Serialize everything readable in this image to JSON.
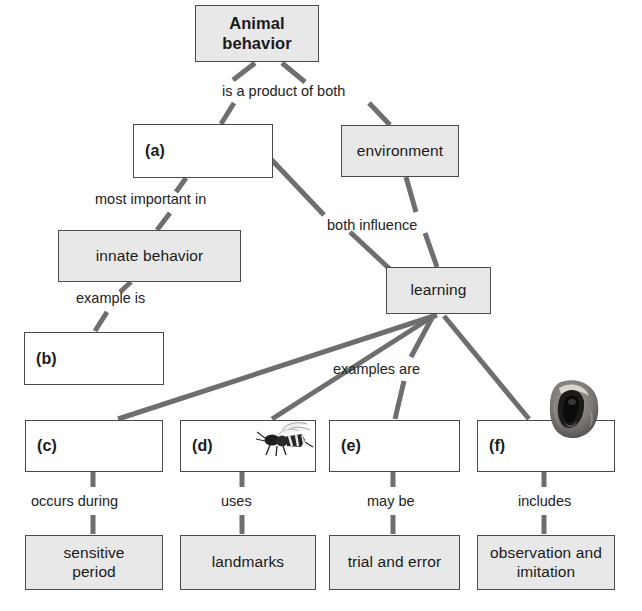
{
  "diagram": {
    "style": {
      "box_border": "#4a4a4a",
      "box_shaded_fill": "#e8e8e8",
      "box_plain_fill": "#ffffff",
      "connector": "#6e6e6e",
      "text": "#1a1a1a",
      "background": "#ffffff"
    },
    "nodes": [
      {
        "id": "animal-behavior",
        "label": "Animal\nbehavior",
        "shaded": true,
        "blank": false,
        "x": 195,
        "y": 5,
        "w": 124,
        "h": 57
      },
      {
        "id": "a",
        "label": "(a)",
        "shaded": false,
        "blank": true,
        "x": 133,
        "y": 124,
        "w": 140,
        "h": 54
      },
      {
        "id": "environment",
        "label": "environment",
        "shaded": true,
        "blank": false,
        "x": 341,
        "y": 125,
        "w": 118,
        "h": 52
      },
      {
        "id": "innate-behavior",
        "label": "innate behavior",
        "shaded": true,
        "blank": false,
        "x": 58,
        "y": 230,
        "w": 183,
        "h": 52
      },
      {
        "id": "learning",
        "label": "learning",
        "shaded": true,
        "blank": false,
        "x": 386,
        "y": 267,
        "w": 105,
        "h": 47
      },
      {
        "id": "b",
        "label": "(b)",
        "shaded": false,
        "blank": true,
        "x": 24,
        "y": 332,
        "w": 140,
        "h": 53
      },
      {
        "id": "c",
        "label": "(c)",
        "shaded": false,
        "blank": true,
        "x": 25,
        "y": 420,
        "w": 138,
        "h": 52
      },
      {
        "id": "d",
        "label": "(d)",
        "shaded": false,
        "blank": true,
        "x": 180,
        "y": 420,
        "w": 136,
        "h": 52
      },
      {
        "id": "e",
        "label": "(e)",
        "shaded": false,
        "blank": true,
        "x": 329,
        "y": 420,
        "w": 131,
        "h": 52
      },
      {
        "id": "f",
        "label": "(f)",
        "shaded": false,
        "blank": true,
        "x": 477,
        "y": 420,
        "w": 138,
        "h": 52
      },
      {
        "id": "sensitive-period",
        "label": "sensitive\nperiod",
        "shaded": true,
        "blank": false,
        "x": 25,
        "y": 535,
        "w": 138,
        "h": 55
      },
      {
        "id": "landmarks",
        "label": "landmarks",
        "shaded": true,
        "blank": false,
        "x": 180,
        "y": 535,
        "w": 136,
        "h": 55
      },
      {
        "id": "trial-and-error",
        "label": "trial and error",
        "shaded": true,
        "blank": false,
        "x": 329,
        "y": 535,
        "w": 131,
        "h": 55
      },
      {
        "id": "observation-and-imitation",
        "label": "observation and\nimitation",
        "shaded": true,
        "blank": false,
        "x": 477,
        "y": 535,
        "w": 138,
        "h": 55
      }
    ],
    "link_labels": [
      {
        "id": "is-a-product-of-both",
        "text": "is a product of both",
        "x": 222,
        "y": 84
      },
      {
        "id": "most-important-in",
        "text": "most important in",
        "x": 95,
        "y": 192
      },
      {
        "id": "both-influence",
        "text": "both influence",
        "x": 327,
        "y": 218
      },
      {
        "id": "example-is",
        "text": "example is",
        "x": 76,
        "y": 291
      },
      {
        "id": "examples-are",
        "text": "examples are",
        "x": 333,
        "y": 362
      },
      {
        "id": "occurs-during",
        "text": "occurs during",
        "x": 31,
        "y": 494
      },
      {
        "id": "uses",
        "text": "uses",
        "x": 221,
        "y": 494
      },
      {
        "id": "may-be",
        "text": "may be",
        "x": 367,
        "y": 494
      },
      {
        "id": "includes",
        "text": "includes",
        "x": 518,
        "y": 494
      }
    ],
    "edges": [
      {
        "id": "animal-behavior-to-a-upper",
        "from": "animal-behavior",
        "to": "is-a-product-of-both",
        "x1": 255,
        "y1": 63,
        "x2": 233,
        "y2": 80
      },
      {
        "id": "animal-behavior-to-environment-upper",
        "from": "animal-behavior",
        "to": "is-a-product-of-both",
        "x1": 282,
        "y1": 63,
        "x2": 305,
        "y2": 82
      },
      {
        "id": "is-a-product-of-both-to-a",
        "from": "is-a-product-of-both",
        "to": "a",
        "x1": 234,
        "y1": 103,
        "x2": 221,
        "y2": 124
      },
      {
        "id": "is-a-product-of-both-to-environment",
        "from": "is-a-product-of-both",
        "to": "environment",
        "x1": 369,
        "y1": 103,
        "x2": 390,
        "y2": 125
      },
      {
        "id": "a-to-most-important-in",
        "from": "a",
        "to": "most-important-in",
        "x1": 186,
        "y1": 178,
        "x2": 176,
        "y2": 192
      },
      {
        "id": "most-important-in-to-innate",
        "from": "most-important-in",
        "to": "innate-behavior",
        "x1": 170,
        "y1": 213,
        "x2": 157,
        "y2": 230
      },
      {
        "id": "a-to-both-influence",
        "from": "a",
        "to": "both-influence",
        "x1": 268,
        "y1": 156,
        "x2": 324,
        "y2": 215
      },
      {
        "id": "environment-to-both-influence",
        "from": "environment",
        "to": "both-influence",
        "x1": 406,
        "y1": 177,
        "x2": 416,
        "y2": 212
      },
      {
        "id": "both-influence-to-learning-left",
        "from": "both-influence",
        "to": "learning",
        "x1": 350,
        "y1": 232,
        "x2": 393,
        "y2": 272
      },
      {
        "id": "both-influence-to-learning-right",
        "from": "both-influence",
        "to": "learning",
        "x1": 425,
        "y1": 233,
        "x2": 437,
        "y2": 267
      },
      {
        "id": "innate-to-example-is",
        "from": "innate-behavior",
        "to": "example-is",
        "x1": 131,
        "y1": 282,
        "x2": 120,
        "y2": 292
      },
      {
        "id": "example-is-to-b",
        "from": "example-is",
        "to": "b",
        "x1": 107,
        "y1": 312,
        "x2": 95,
        "y2": 331
      },
      {
        "id": "learning-to-c",
        "from": "learning",
        "to": "c",
        "x1": 437,
        "y1": 315,
        "x2": 118,
        "y2": 419
      },
      {
        "id": "learning-to-d",
        "from": "learning",
        "to": "d",
        "x1": 435,
        "y1": 315,
        "x2": 272,
        "y2": 419
      },
      {
        "id": "learning-to-examples-are",
        "from": "learning",
        "to": "examples-are",
        "x1": 433,
        "y1": 316,
        "x2": 411,
        "y2": 357
      },
      {
        "id": "learning-to-f",
        "from": "learning",
        "to": "f",
        "x1": 444,
        "y1": 316,
        "x2": 529,
        "y2": 419
      },
      {
        "id": "examples-are-to-e",
        "from": "examples-are",
        "to": "e",
        "x1": 404,
        "y1": 381,
        "x2": 395,
        "y2": 419
      },
      {
        "id": "c-to-occurs-during",
        "from": "c",
        "to": "occurs-during",
        "x1": 93,
        "y1": 472,
        "x2": 93,
        "y2": 487
      },
      {
        "id": "occurs-during-to-sensitive-period",
        "from": "occurs-during",
        "to": "sensitive-period",
        "x1": 93,
        "y1": 515,
        "x2": 93,
        "y2": 534
      },
      {
        "id": "d-to-uses",
        "from": "d",
        "to": "uses",
        "x1": 242,
        "y1": 472,
        "x2": 242,
        "y2": 487
      },
      {
        "id": "uses-to-landmarks",
        "from": "uses",
        "to": "landmarks",
        "x1": 242,
        "y1": 515,
        "x2": 242,
        "y2": 534
      },
      {
        "id": "e-to-may-be",
        "from": "e",
        "to": "may-be",
        "x1": 393,
        "y1": 472,
        "x2": 393,
        "y2": 487
      },
      {
        "id": "may-be-to-trial-and-error",
        "from": "may-be",
        "to": "trial-and-error",
        "x1": 393,
        "y1": 515,
        "x2": 393,
        "y2": 534
      },
      {
        "id": "f-to-includes",
        "from": "f",
        "to": "includes",
        "x1": 544,
        "y1": 472,
        "x2": 544,
        "y2": 487
      },
      {
        "id": "includes-to-observation",
        "from": "includes",
        "to": "observation-and-imitation",
        "x1": 544,
        "y1": 515,
        "x2": 544,
        "y2": 534
      }
    ],
    "photos": [
      {
        "id": "wasp-photo",
        "name": "wasp-photo",
        "x": 252,
        "y": 421,
        "w": 64,
        "h": 38
      },
      {
        "id": "monkey-photo",
        "name": "monkey-photo",
        "x": 545,
        "y": 378,
        "w": 56,
        "h": 62
      }
    ]
  }
}
